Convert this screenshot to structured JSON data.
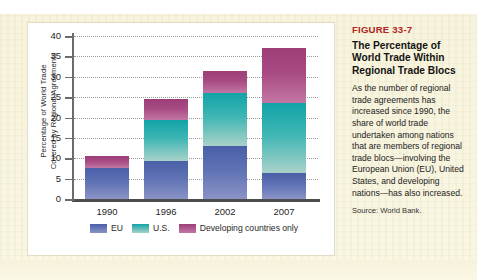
{
  "figure": {
    "number": "FIGURE 33-7",
    "title": "The Percentage of World Trade Within Regional Trade Blocs",
    "body": "As the number of regional trade agreements has increased since 1990, the share of world trade undertaken among nations that are members of regional trade blocs—involving the European Union (EU), United States, and developing nations—has also increased.",
    "source": "Source: World Bank."
  },
  "chart_data": {
    "type": "bar",
    "subtype": "stacked",
    "title": "",
    "xlabel": "",
    "ylabel": "Percentage of World Trade Covered by Regional Agreements",
    "ylabel_lines": [
      "Percentage of World Trade",
      "Covered by Regional Agreements"
    ],
    "categories": [
      "1990",
      "1996",
      "2002",
      "2007"
    ],
    "ylim": [
      0,
      40
    ],
    "yticks": [
      0,
      5,
      10,
      15,
      20,
      25,
      30,
      35,
      40
    ],
    "grid": true,
    "grid_style": "dotted-horizontal",
    "legend_position": "bottom",
    "series": [
      {
        "name": "EU",
        "color": "#5f72b4",
        "values": [
          7.5,
          9.3,
          13.0,
          6.5
        ]
      },
      {
        "name": "U.S.",
        "color": "#3fb6b4",
        "values": [
          0,
          10.0,
          13.0,
          17.0
        ]
      },
      {
        "name": "Developing countries only",
        "color": "#a84a83",
        "values": [
          3.0,
          5.2,
          5.5,
          13.5
        ]
      }
    ],
    "totals": [
      10.5,
      24.5,
      31.5,
      37.0
    ]
  },
  "colors": {
    "accent_red": "#b0241f",
    "eu": "#5f72b4",
    "us": "#3fb6b4",
    "developing": "#a84a83",
    "page_background": "#f8f4dd",
    "panel_background": "#ffffff"
  }
}
